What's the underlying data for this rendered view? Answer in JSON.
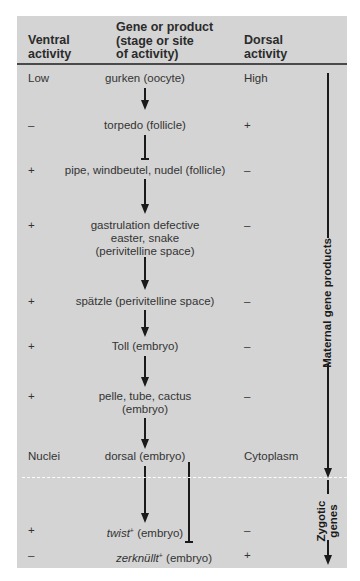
{
  "header": {
    "ventral": "Ventral\nactivity",
    "ventral_l1": "Ventral",
    "ventral_l2": "activity",
    "gene_l1": "Gene or product",
    "gene_l2": "(stage or site",
    "gene_l3": "of activity)",
    "dorsal_l1": "Dorsal",
    "dorsal_l2": "activity"
  },
  "rows": [
    {
      "ventral": "Low",
      "gene": "gurken (oocyte)",
      "dorsal": "High"
    },
    {
      "ventral": "–",
      "gene": "torpedo (follicle)",
      "dorsal": "+"
    },
    {
      "ventral": "+",
      "gene": "pipe, windbeutel, nudel (follicle)",
      "dorsal": "–"
    },
    {
      "ventral": "+",
      "gene_l1": "gastrulation defective",
      "gene_l2": "easter, snake",
      "gene_l3": "(perivitelline space)",
      "dorsal": "–"
    },
    {
      "ventral": "+",
      "gene": "spätzle (perivitelline space)",
      "dorsal": "–"
    },
    {
      "ventral": "+",
      "gene": "Toll (embryo)",
      "dorsal": "–"
    },
    {
      "ventral": "+",
      "gene_l1": "pelle, tube, cactus",
      "gene_l2": "(embryo)",
      "dorsal": "–"
    },
    {
      "ventral": "Nuclei",
      "gene": "dorsal (embryo)",
      "dorsal": "Cytoplasm"
    },
    {
      "ventral": "+",
      "gene_italic": "twist",
      "gene_sup": "+",
      "gene_rest": " (embryo)",
      "dorsal": "–"
    },
    {
      "ventral": "–",
      "gene_italic": "zerknüllt",
      "gene_sup": "+",
      "gene_rest": " (embryo)",
      "dorsal": "+"
    }
  ],
  "side_labels": {
    "maternal": "Maternal gene products",
    "zygotic_l1": "Zygotic",
    "zygotic_l2": "genes"
  },
  "colors": {
    "panel": "#d4d4d4",
    "lines": "#1a1a1a",
    "divider": "#ffffff"
  }
}
